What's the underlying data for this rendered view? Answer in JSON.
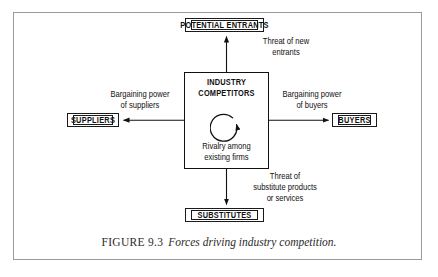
{
  "figure": {
    "caption_label": "FIGURE 9.3",
    "caption_text": "Forces driving industry competition.",
    "frame_color": "#9a9a9a",
    "line_color": "#111111",
    "background": "#ffffff"
  },
  "nodes": {
    "potential_entrants": "POTENTIAL ENTRANTS",
    "suppliers": "SUPPLIERS",
    "buyers": "BUYERS",
    "substitutes": "SUBSTITUTES",
    "industry_competitors_line1": "INDUSTRY",
    "industry_competitors_line2": "COMPETITORS",
    "rivalry_line1": "Rivalry among",
    "rivalry_line2": "existing firms"
  },
  "edges": {
    "threat_new_entrants_line1": "Threat of new",
    "threat_new_entrants_line2": "entrants",
    "bargaining_suppliers_line1": "Bargaining power",
    "bargaining_suppliers_line2": "of suppliers",
    "bargaining_buyers_line1": "Bargaining power",
    "bargaining_buyers_line2": "of buyers",
    "threat_substitutes_line1": "Threat of",
    "threat_substitutes_line2": "substitute products",
    "threat_substitutes_line3": "or services"
  },
  "icons": {
    "rivalry": "circular-arrow-icon",
    "arrow_up": "arrow-up-icon",
    "arrow_down": "arrow-down-icon",
    "arrow_left": "arrow-left-icon",
    "arrow_right": "arrow-right-icon"
  }
}
